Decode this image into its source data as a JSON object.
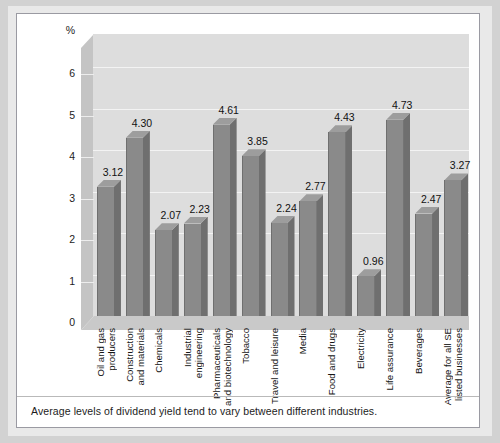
{
  "caption": "Average levels of dividend yield tend to vary between different industries.",
  "axis": {
    "unit_label": "%",
    "yticks": [
      "0",
      "1",
      "2",
      "3",
      "4",
      "5",
      "6"
    ]
  },
  "colors": {
    "bar_front": "#8a8a8a",
    "bar_side": "#6f6f6f",
    "bar_top": "#9d9d9d",
    "plot_background": "#dddddd",
    "gridline": "#f3f3f3",
    "card_background": "#ffffff",
    "page_background": "#d2d2d2"
  },
  "chart_data": {
    "type": "bar",
    "title": "",
    "xlabel": "",
    "ylabel": "%",
    "ylim": [
      0,
      6.8
    ],
    "grid": true,
    "legend": "none",
    "categories": [
      "Oil and gas producers",
      "Construction and materials",
      "Chemicals",
      "Industrial engineering",
      "Pharmaceuticals and biotechnology",
      "Tobacco",
      "Travel and leisure",
      "Media",
      "Food and drugs",
      "Electricity",
      "Life assurance",
      "Beverages",
      "Average for all SE listed businesses"
    ],
    "category_lines": [
      [
        "Oil and gas",
        "producers"
      ],
      [
        "Construction",
        "and  materials"
      ],
      [
        "Chemicals"
      ],
      [
        "Industrial",
        "engineering"
      ],
      [
        "Pharmaceuticals",
        "and biotechnology"
      ],
      [
        "Tobacco"
      ],
      [
        "Travel and leisure"
      ],
      [
        "Media"
      ],
      [
        "Food and drugs"
      ],
      [
        "Electricity"
      ],
      [
        "Life assurance"
      ],
      [
        "Beverages"
      ],
      [
        "Average for all SE",
        "listed businesses"
      ]
    ],
    "values": [
      3.12,
      4.3,
      2.07,
      2.23,
      4.61,
      3.85,
      2.24,
      2.77,
      4.43,
      0.96,
      4.73,
      2.47,
      3.27
    ],
    "value_labels": [
      "3.12",
      "4.30",
      "2.07",
      "2.23",
      "4.61",
      "3.85",
      "2.24",
      "2.77",
      "4.43",
      "0.96",
      "4.73",
      "2.47",
      "3.27"
    ]
  }
}
